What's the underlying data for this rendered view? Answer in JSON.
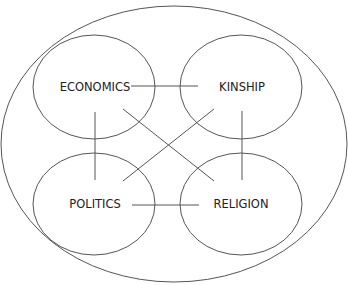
{
  "diagram": {
    "nodes": [
      {
        "id": "economics",
        "label": "ECONOMICS",
        "cx": 94,
        "cy": 87
      },
      {
        "id": "kinship",
        "label": "KINSHIP",
        "cx": 241,
        "cy": 87
      },
      {
        "id": "politics",
        "label": "POLITICS",
        "cx": 94,
        "cy": 204
      },
      {
        "id": "religion",
        "label": "RELIGION",
        "cx": 241,
        "cy": 204
      }
    ],
    "edges": [
      {
        "from": "economics",
        "to": "kinship"
      },
      {
        "from": "economics",
        "to": "politics"
      },
      {
        "from": "economics",
        "to": "religion"
      },
      {
        "from": "kinship",
        "to": "politics"
      },
      {
        "from": "kinship",
        "to": "religion"
      },
      {
        "from": "politics",
        "to": "religion"
      }
    ],
    "container": "enclosing-ellipse"
  }
}
